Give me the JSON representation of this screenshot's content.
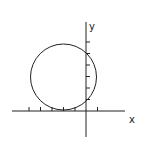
{
  "diagram": {
    "type": "coordinate-plane-with-circle",
    "axes": {
      "x_label": "x",
      "y_label": "y",
      "origin_px": [
        86,
        111
      ],
      "x_axis_px": {
        "from": 12,
        "to": 125
      },
      "y_axis_px": {
        "from": 22,
        "to": 137
      },
      "unit_px": 11.5,
      "x_ticks": [
        -5,
        -4,
        -3,
        -2,
        -1,
        1
      ],
      "y_ticks": [
        1,
        2,
        3,
        4,
        5,
        6
      ]
    },
    "circle": {
      "center": [
        -2,
        3
      ],
      "radius": 3,
      "tangent_to": "x-axis",
      "center_px": [
        63,
        77
      ],
      "radius_px": 33
    },
    "colors": {
      "stroke": "#222222",
      "background": "#ffffff"
    }
  }
}
